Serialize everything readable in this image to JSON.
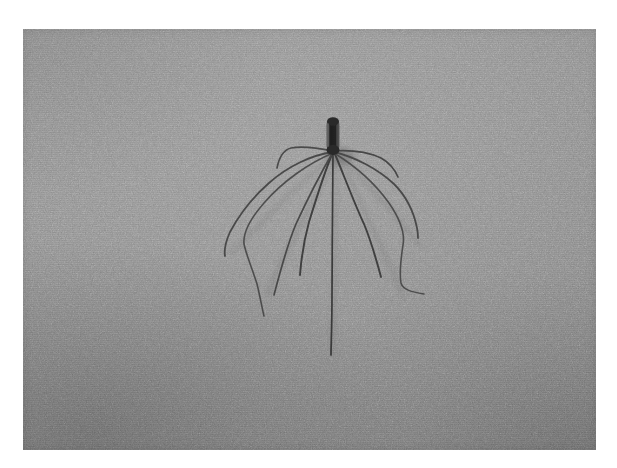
{
  "page": {
    "kind": "photograph",
    "background_color": "#ffffff",
    "border_color": "#ffffff"
  },
  "photo": {
    "caption_visible": false,
    "subject_name": "harvestman-arthropod",
    "subject_common_name": "daddy-long-legs",
    "scene_description": "A long-legged arthropod with a dark elongated body resting on a flat gray surface",
    "background_tone": "#8a8a8a",
    "subject_color": "#3b3b3b",
    "leg_color": "#4a4a4a",
    "shadow_color": "#7a7a7a",
    "frame": {
      "x": 23,
      "y": 29,
      "width": 573,
      "height": 421
    },
    "body": {
      "center_x": 333,
      "top_y": 119,
      "bottom_y": 152,
      "width": 13,
      "height": 33
    },
    "leg_origin": {
      "x": 333,
      "y": 151
    },
    "leg_count": 10,
    "legs": [
      {
        "id": "leg-l1",
        "label": "upper-left-leg",
        "tip_x": 277,
        "tip_y": 168
      },
      {
        "id": "leg-l2",
        "label": "left-leg",
        "tip_x": 225,
        "tip_y": 256
      },
      {
        "id": "leg-l3",
        "label": "lower-left-leg",
        "tip_x": 264,
        "tip_y": 316
      },
      {
        "id": "leg-l4",
        "label": "long-lower-left-leg",
        "tip_x": 274,
        "tip_y": 295
      },
      {
        "id": "leg-l5",
        "label": "inner-left-leg",
        "tip_x": 300,
        "tip_y": 275
      },
      {
        "id": "leg-c",
        "label": "center-trailing-leg",
        "tip_x": 331,
        "tip_y": 355
      },
      {
        "id": "leg-r1",
        "label": "upper-right-leg",
        "tip_x": 398,
        "tip_y": 177
      },
      {
        "id": "leg-r2",
        "label": "right-leg",
        "tip_x": 418,
        "tip_y": 238
      },
      {
        "id": "leg-r3",
        "label": "lower-right-leg",
        "tip_x": 424,
        "tip_y": 294
      },
      {
        "id": "leg-r4",
        "label": "inner-right-leg",
        "tip_x": 381,
        "tip_y": 277
      }
    ]
  }
}
